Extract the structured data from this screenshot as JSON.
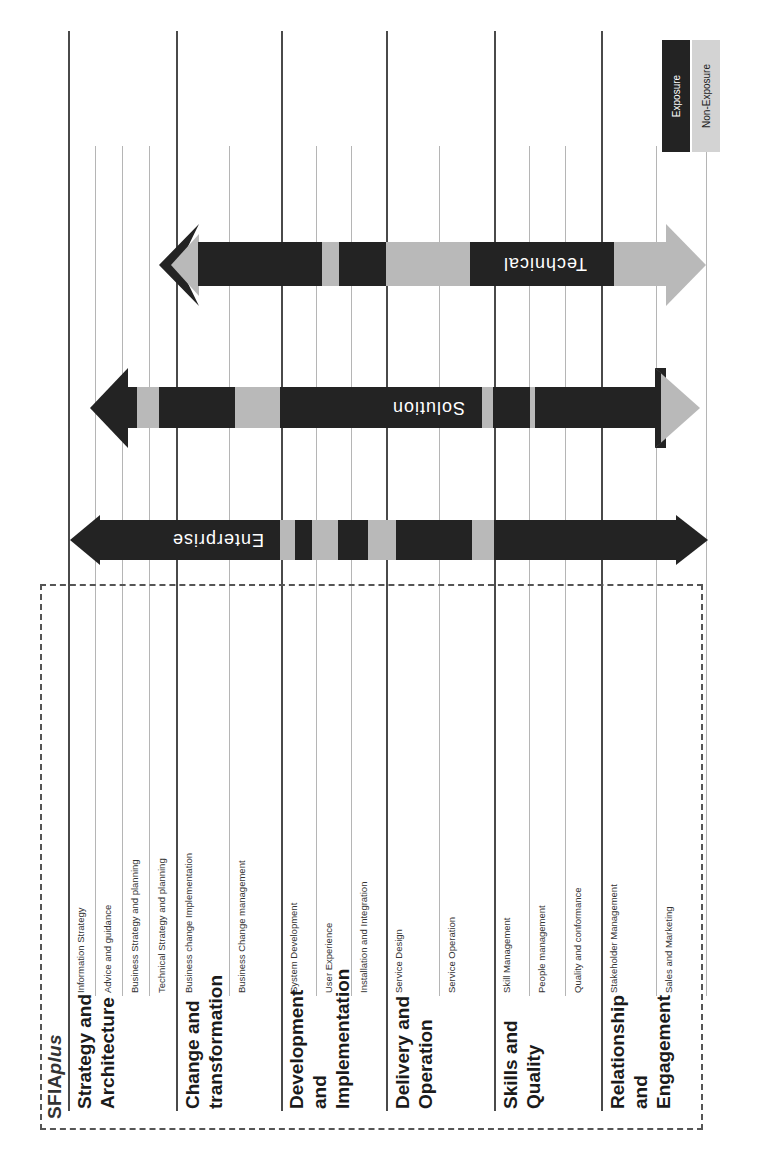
{
  "brand": {
    "prefix": "SFIA",
    "suffix": "plus"
  },
  "legend": {
    "exposure_label": "Exposure",
    "non_exposure_label": "Non-Exposure",
    "exposure_color": "#232323",
    "non_exposure_color": "#b9b9b9"
  },
  "categories": [
    {
      "label_lines": [
        "Strategy and",
        "Architecture"
      ],
      "skills": [
        "Information Strategy",
        "Advice and guidance",
        "Business Strategy and planning",
        "Technical Strategy and planning"
      ]
    },
    {
      "label_lines": [
        "Change and",
        "transformation"
      ],
      "skills": [
        "Business change Implementation",
        "Business Change management"
      ]
    },
    {
      "label_lines": [
        "Development",
        "and",
        "Implementation"
      ],
      "skills": [
        "System Development",
        "User Experience",
        "Installation and Integration"
      ]
    },
    {
      "label_lines": [
        "Delivery and",
        "Operation"
      ],
      "skills": [
        "Service Design",
        "Service Operation"
      ]
    },
    {
      "label_lines": [
        "Skills and",
        "Quality"
      ],
      "skills": [
        "Skill Management",
        "People management",
        "Quality and conformance"
      ]
    },
    {
      "label_lines": [
        "Relationship",
        "and",
        "Engagement"
      ],
      "skills": [
        "Stakeholder Management",
        "Sales and Marketing"
      ]
    }
  ],
  "arrows": [
    {
      "name": "Enterprise",
      "label": "Enterprise",
      "segments_exposure": [
        "exposure",
        "non-exposure",
        "exposure",
        "non-exposure",
        "exposure",
        "non-exposure",
        "exposure",
        "non-exposure",
        "exposure"
      ]
    },
    {
      "name": "Solution",
      "label": "Solution",
      "segments_exposure": [
        "exposure",
        "non-exposure",
        "exposure",
        "non-exposure",
        "exposure",
        "non-exposure",
        "exposure",
        "non-exposure",
        "exposure",
        "non-exposure"
      ]
    },
    {
      "name": "Technical",
      "label": "Technical",
      "segments_exposure": [
        "non-exposure",
        "exposure",
        "non-exposure",
        "exposure",
        "non-exposure",
        "exposure",
        "non-exposure"
      ]
    }
  ]
}
